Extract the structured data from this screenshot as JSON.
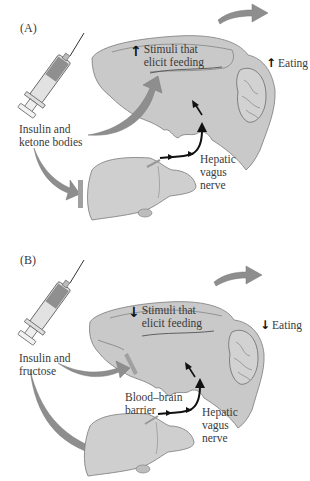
{
  "colors": {
    "organ_fill": "#c9c9c9",
    "organ_stroke": "#7a7a7a",
    "flow_arrow": "#8e8e8e",
    "barrier": "#a0a0a0",
    "nerve": "#111111",
    "text": "#3a3a3a"
  },
  "panels": [
    {
      "label": "(A)",
      "injection_label_line1": "Insulin and",
      "injection_label_line2": "ketone bodies",
      "stimuli_direction": "↑",
      "stimuli_line1": "Stimuli that",
      "stimuli_line2": "elicit feeding",
      "eating_direction": "↑",
      "eating_label": "Eating",
      "nerve_line1": "Hepatic",
      "nerve_line2": "vagus",
      "nerve_line3": "nerve",
      "icons": [
        "syringe-icon",
        "brain-icon",
        "liver-icon",
        "blocked-barrier-at-liver"
      ]
    },
    {
      "label": "(B)",
      "injection_label_line1": "Insulin and",
      "injection_label_line2": "fructose",
      "stimuli_direction": "↓",
      "stimuli_line1": "Stimuli that",
      "stimuli_line2": "elicit feeding",
      "eating_direction": "↓",
      "eating_label": "Eating",
      "barrier_line1": "Blood–brain",
      "barrier_line2": "barrier",
      "nerve_line1": "Hepatic",
      "nerve_line2": "vagus",
      "nerve_line3": "nerve",
      "icons": [
        "syringe-icon",
        "brain-icon",
        "liver-icon",
        "blood-brain-barrier"
      ]
    }
  ]
}
